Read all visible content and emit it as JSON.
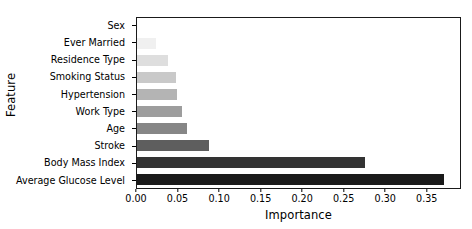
{
  "chart_data": {
    "type": "bar",
    "orientation": "horizontal",
    "title": "",
    "xlabel": "Importance",
    "ylabel": "Feature",
    "categories": [
      "Sex",
      "Ever Married",
      "Residence Type",
      "Smoking Status",
      "Hypertension",
      "Work Type",
      "Age",
      "Stroke",
      "Body Mass Index",
      "Average Glucose Level"
    ],
    "values": [
      0.001,
      0.023,
      0.037,
      0.047,
      0.048,
      0.054,
      0.061,
      0.087,
      0.276,
      0.372
    ],
    "bar_colors": [
      "#fbfbfb",
      "#f0f0f0",
      "#dedede",
      "#c9c9c9",
      "#b4b4b4",
      "#9d9d9d",
      "#868686",
      "#5e5e5e",
      "#333333",
      "#1a1a1a"
    ],
    "xlim": [
      0.0,
      0.3912
    ],
    "xticks": [
      0.0,
      0.05,
      0.1,
      0.15,
      0.2,
      0.25,
      0.3,
      0.35
    ],
    "xtick_labels": [
      "0.00",
      "0.05",
      "0.10",
      "0.15",
      "0.20",
      "0.25",
      "0.30",
      "0.35"
    ],
    "grid": false,
    "legend": null,
    "axis_color": "#1a1a1a",
    "background": "#ffffff"
  }
}
